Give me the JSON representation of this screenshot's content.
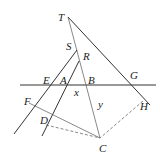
{
  "diagram": {
    "type": "geometry",
    "labels": {
      "T": "T",
      "S": "S",
      "R": "R",
      "E": "E",
      "A": "A",
      "B": "B",
      "G": "G",
      "F": "F",
      "D": "D",
      "H": "H",
      "C": "C",
      "x": "x",
      "y": "y"
    },
    "points": {
      "T": [
        68,
        17
      ],
      "S": [
        77,
        50
      ],
      "R": [
        79,
        62
      ],
      "E": [
        50,
        85
      ],
      "A": [
        65,
        85
      ],
      "B": [
        86,
        85
      ],
      "G": [
        132,
        85
      ],
      "F": [
        29,
        103
      ],
      "D": [
        47,
        120
      ],
      "H": [
        143,
        100
      ],
      "C": [
        100,
        138
      ]
    },
    "colors": {
      "stroke": "#333333",
      "text": "#222222",
      "background": "#ffffff"
    }
  }
}
